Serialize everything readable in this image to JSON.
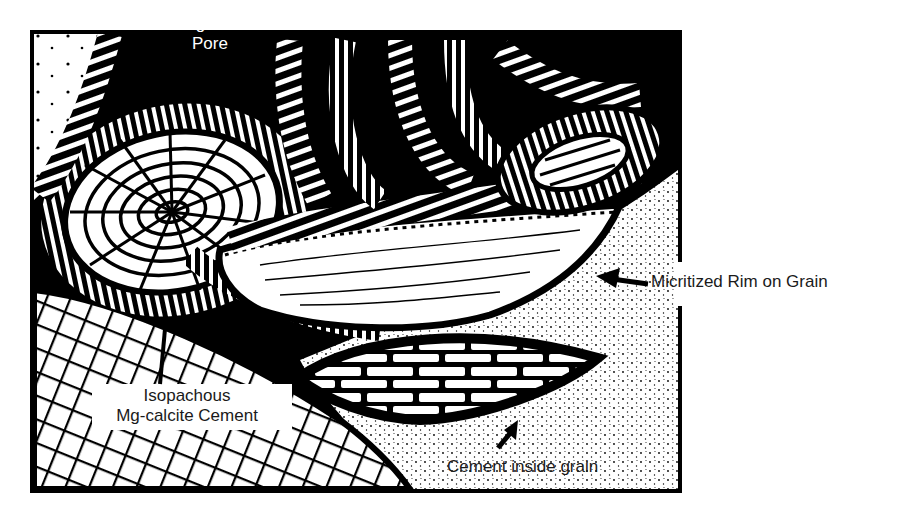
{
  "figure": {
    "type": "petrographic-sketch",
    "colors": {
      "ink": "#000000",
      "paper": "#ffffff",
      "label": "#1a1a1a"
    }
  },
  "labels": {
    "intergranular_pore": {
      "line1": "Intergranular",
      "line2": "Pore"
    },
    "micritized_rim": "Micritized Rim on Grain",
    "isopachous_cement": {
      "line1": "Isopachous",
      "line2": "Mg-calcite Cement"
    },
    "cement_inside_grain": "Cement inside grain"
  }
}
